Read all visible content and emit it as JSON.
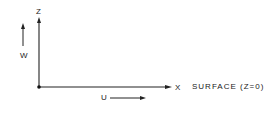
{
  "diagram": {
    "axes": {
      "vertical_label": "Z",
      "horizontal_label": "X"
    },
    "velocity_labels": {
      "vertical": "W",
      "horizontal": "U"
    },
    "surface_label": "SURFACE (Z=0)",
    "colors": {
      "ink": "#222222",
      "background": "#ffffff"
    }
  }
}
